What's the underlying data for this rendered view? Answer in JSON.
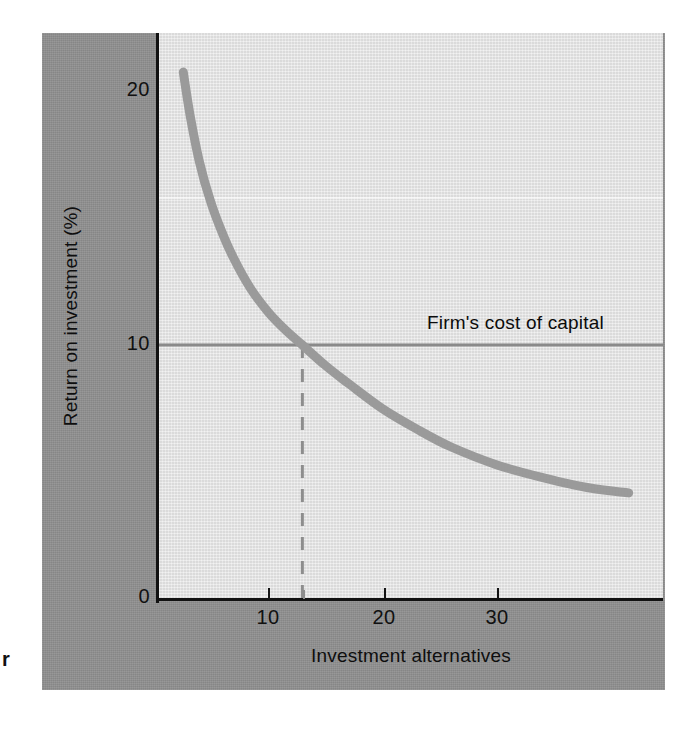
{
  "figure": {
    "corner_mark": "r",
    "curve_color": "#9a9a9a",
    "hline_color": "#8a8a8a",
    "dashed_color": "#8d8d8d",
    "axis_color": "#121212",
    "panel_color": "#8f8f8f",
    "plot_background": "#e2e2e2"
  },
  "chart_data": {
    "type": "line",
    "title": "",
    "xlabel": "Investment alternatives",
    "ylabel": "Return on investment (%)",
    "xlim": [
      1,
      45
    ],
    "ylim": [
      0,
      22.3
    ],
    "grid": false,
    "legend": "none",
    "x_ticks": [
      10,
      20,
      30
    ],
    "x_tick_labels": [
      "10",
      "20",
      "30"
    ],
    "y_ticks": [
      0,
      10,
      20
    ],
    "y_tick_labels": [
      "0",
      "10",
      "20"
    ],
    "series": [
      {
        "name": "Investment opportunity schedule",
        "style": "solid",
        "points": [
          {
            "x": 2.6,
            "y": 20.7
          },
          {
            "x": 3.2,
            "y": 19.0
          },
          {
            "x": 4.0,
            "y": 17.2
          },
          {
            "x": 5.0,
            "y": 15.6
          },
          {
            "x": 6.0,
            "y": 14.4
          },
          {
            "x": 7.0,
            "y": 13.4
          },
          {
            "x": 8.5,
            "y": 12.2
          },
          {
            "x": 10.0,
            "y": 11.3
          },
          {
            "x": 11.5,
            "y": 10.6
          },
          {
            "x": 13.0,
            "y": 10.0
          },
          {
            "x": 15.0,
            "y": 9.2
          },
          {
            "x": 17.0,
            "y": 8.5
          },
          {
            "x": 20.0,
            "y": 7.5
          },
          {
            "x": 23.0,
            "y": 6.7
          },
          {
            "x": 26.0,
            "y": 6.0
          },
          {
            "x": 30.0,
            "y": 5.3
          },
          {
            "x": 34.0,
            "y": 4.8
          },
          {
            "x": 38.0,
            "y": 4.4
          },
          {
            "x": 41.5,
            "y": 4.2
          }
        ]
      },
      {
        "name": "Firm's cost of capital",
        "style": "horizontal-line",
        "y_value": 10.0,
        "x_start": 1,
        "x_end": 45
      },
      {
        "name": "Optimal capital budget marker",
        "style": "dashed-vertical",
        "x_value": 13.0,
        "y_start": 0,
        "y_end": 10.0
      }
    ],
    "annotations": [
      {
        "text": "Firm's cost of capital",
        "x": 24.3,
        "y": 11.3
      }
    ],
    "intersection": {
      "x": 13.0,
      "y": 10.0
    }
  }
}
